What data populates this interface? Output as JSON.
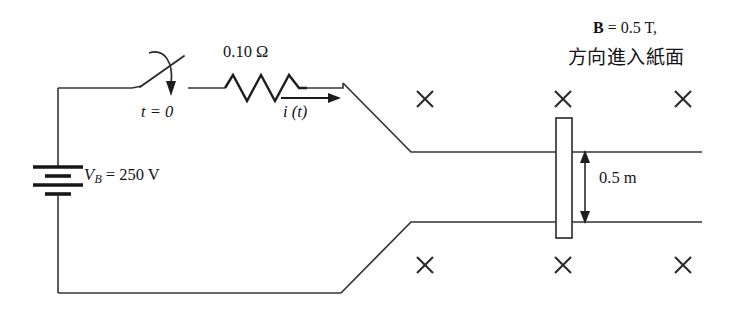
{
  "figure": {
    "kind": "circuit-diagram",
    "background_color": "#ffffff",
    "line_color": "#333436",
    "ink_color": "#131316",
    "width": 744,
    "height": 312
  },
  "labels": {
    "resistance": "0.10 Ω",
    "switch_time": "t = 0",
    "current": "i (t)",
    "battery_prefix": "V",
    "battery_subscript": "B",
    "battery_value": " = 250 V",
    "field_strength_symbol": "B",
    "field_strength_value": " = 0.5 T,",
    "field_direction": "方向進入紙面",
    "rod_length": "0.5 m"
  },
  "components": {
    "battery": {
      "name": "dc-voltage-source",
      "voltage": "250 V",
      "plate_count": 4
    },
    "resistor": {
      "name": "resistor",
      "resistance": "0.10 Ω",
      "zigzag_peaks": 3
    },
    "switch": {
      "name": "switch",
      "state": "open",
      "closes_at": "t = 0"
    },
    "rod": {
      "name": "sliding-conducting-rod",
      "separation": "0.5 m"
    }
  },
  "field": {
    "symbol": "B",
    "magnitude": "0.5 T",
    "direction": "方向進入紙面",
    "marker_glyph": "×",
    "marker_count": 6,
    "marker_positions": [
      {
        "x": 425,
        "y": 99
      },
      {
        "x": 563,
        "y": 99
      },
      {
        "x": 683,
        "y": 99
      },
      {
        "x": 425,
        "y": 265
      },
      {
        "x": 563,
        "y": 265
      },
      {
        "x": 683,
        "y": 265
      }
    ]
  },
  "geometry": {
    "top_wire_y": 88,
    "bottom_wire_y": 293,
    "left_wire_x": 58,
    "rail_top_y": 152,
    "rail_bottom_y": 222,
    "rail_right_x": 702,
    "rod_x": 556,
    "rod_width": 16,
    "rod_top_y": 118,
    "rod_bottom_y": 238
  }
}
